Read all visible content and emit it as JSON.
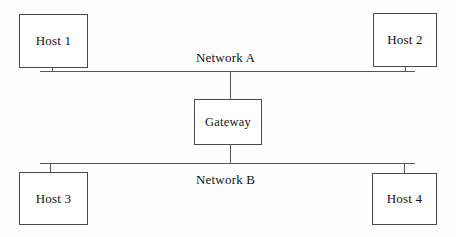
{
  "diagram": {
    "colors": {
      "stroke": "#4a4a4a",
      "line": "#555555",
      "text": "#111111",
      "background": "#fefefe"
    },
    "nodes": [
      {
        "id": "host1",
        "label": "Host 1",
        "network": "Network A"
      },
      {
        "id": "host2",
        "label": "Host 2",
        "network": "Network A"
      },
      {
        "id": "gateway",
        "label": "Gateway",
        "network": "Network A, Network B"
      },
      {
        "id": "host3",
        "label": "Host 3",
        "network": "Network B"
      },
      {
        "id": "host4",
        "label": "Host 4",
        "network": "Network B"
      }
    ],
    "buses": [
      {
        "id": "network-a",
        "label": "Network A"
      },
      {
        "id": "network-b",
        "label": "Network B"
      }
    ]
  }
}
